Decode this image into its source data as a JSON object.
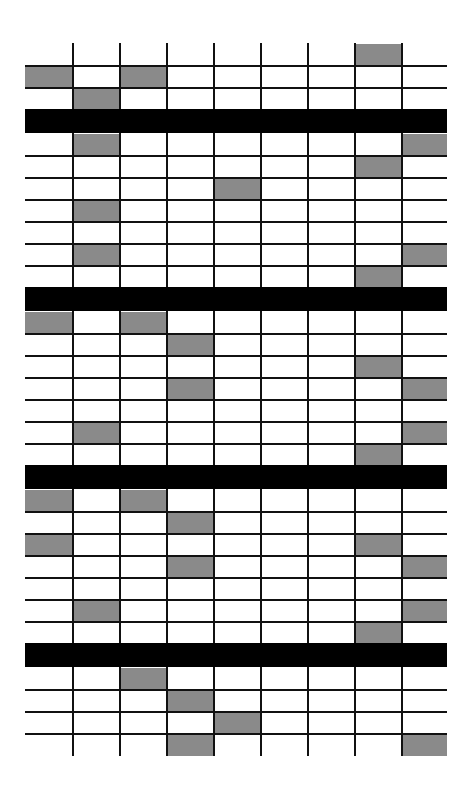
{
  "colors": {
    "background": "#ffffff",
    "filled_cell": "#8a8a8a",
    "grid_line": "#111111",
    "separator_bar": "#000000"
  },
  "grid": {
    "left": 25,
    "right": 447,
    "top": 43,
    "bottom": 756,
    "columns": 9,
    "row_height": 22,
    "bar_height": 24,
    "vertical_lines_x": [
      72,
      119,
      166,
      213,
      260,
      307,
      354,
      401
    ]
  },
  "segments": [
    {
      "name": "segment-1",
      "rows": [
        [
          8
        ],
        [
          1,
          3
        ],
        [
          2
        ]
      ],
      "top_open": true
    },
    {
      "name": "segment-2",
      "rows": [
        [
          2,
          9
        ],
        [
          8
        ],
        [
          5
        ],
        [
          2
        ],
        [],
        [
          2,
          9
        ],
        [
          8
        ]
      ]
    },
    {
      "name": "segment-3",
      "rows": [
        [
          1,
          3
        ],
        [
          4
        ],
        [
          8
        ],
        [
          4,
          9
        ],
        [],
        [
          2,
          9
        ],
        [
          8
        ]
      ]
    },
    {
      "name": "segment-4",
      "rows": [
        [
          1,
          3
        ],
        [
          4
        ],
        [
          1,
          8
        ],
        [
          4,
          9
        ],
        [],
        [
          2,
          9
        ],
        [
          8
        ]
      ]
    },
    {
      "name": "segment-5",
      "rows": [
        [
          3
        ],
        [
          4
        ],
        [
          5
        ],
        [
          4,
          9
        ]
      ],
      "bottom_open": true
    }
  ]
}
